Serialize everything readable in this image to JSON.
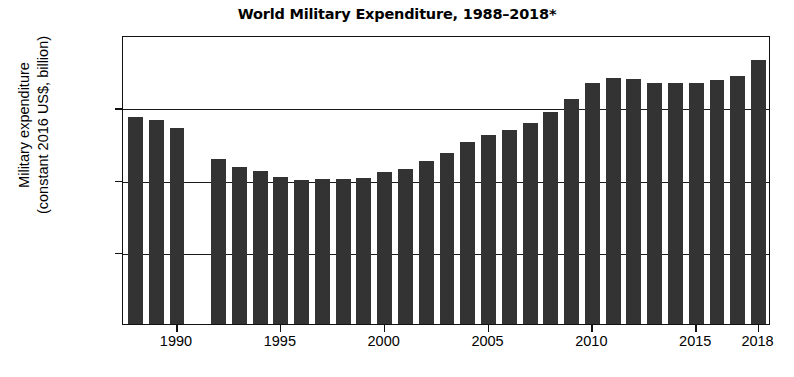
{
  "chart_data": {
    "type": "bar",
    "title": "World Military Expenditure, 1988–2018*",
    "xlabel": "",
    "ylabel": "Military expenditure (constant 2016 US$, billion)",
    "ylabel_line1": "Military expenditure",
    "ylabel_line2": "(constant 2016 US$, billion)",
    "ylim": [
      0,
      2000
    ],
    "xlim": [
      1987.4,
      2018.6
    ],
    "yticks": [
      0,
      500,
      1000,
      1500,
      2000
    ],
    "ytick_labels": [
      "0",
      "500",
      "1,000",
      "1,500",
      "2,000"
    ],
    "xticks": [
      1990,
      1995,
      2000,
      2005,
      2010,
      2015,
      2018
    ],
    "xtick_labels": [
      "1990",
      "1995",
      "2000",
      "2005",
      "2010",
      "2015",
      "2018"
    ],
    "grid": true,
    "grid_axis": "y",
    "legend": null,
    "bar_color": "#333333",
    "categories": [
      1988,
      1989,
      1990,
      1991,
      1992,
      1993,
      1994,
      1995,
      1996,
      1997,
      1998,
      1999,
      2000,
      2001,
      2002,
      2003,
      2004,
      2005,
      2006,
      2007,
      2008,
      2009,
      2010,
      2011,
      2012,
      2013,
      2014,
      2015,
      2016,
      2017,
      2018
    ],
    "values": [
      1432,
      1412,
      1355,
      null,
      1143,
      1090,
      1060,
      1015,
      1000,
      1005,
      1005,
      1010,
      1055,
      1075,
      1125,
      1185,
      1260,
      1305,
      1345,
      1390,
      1465,
      1555,
      1665,
      1700,
      1695,
      1665,
      1665,
      1670,
      1690,
      1715,
      1830
    ],
    "missing_years": [
      1991
    ],
    "units": "billion constant 2016 US$"
  }
}
